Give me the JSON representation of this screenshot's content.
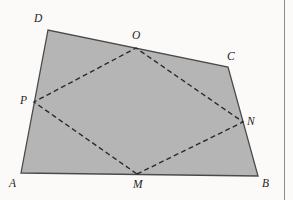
{
  "figure": {
    "type": "geometry-diagram",
    "background_color": "#fbfaf8",
    "fill_color": "#b5b5b5",
    "outline_color": "#4a4a4a",
    "dash_color": "#2b2b2b",
    "outline_width": 1.3,
    "dash_width": 1.4,
    "dash_pattern": "5,3.2",
    "outer_vertices": [
      {
        "id": "A",
        "label": "A",
        "x": 21,
        "y": 173,
        "label_x": 9,
        "label_y": 178
      },
      {
        "id": "B",
        "label": "B",
        "x": 258,
        "y": 176,
        "label_x": 262,
        "label_y": 178
      },
      {
        "id": "C",
        "label": "C",
        "x": 228,
        "y": 67,
        "label_x": 227,
        "label_y": 51
      },
      {
        "id": "D",
        "label": "D",
        "x": 48,
        "y": 30,
        "label_x": 34,
        "label_y": 13
      }
    ],
    "midpoints": [
      {
        "id": "M",
        "label": "M",
        "on_side": "AB",
        "x": 137,
        "y": 174,
        "label_x": 133,
        "label_y": 179
      },
      {
        "id": "N",
        "label": "N",
        "on_side": "BC",
        "x": 243,
        "y": 122,
        "label_x": 247,
        "label_y": 116
      },
      {
        "id": "O",
        "label": "O",
        "on_side": "CD",
        "x": 136,
        "y": 48,
        "label_x": 132,
        "label_y": 30
      },
      {
        "id": "P",
        "label": "P",
        "on_side": "DA",
        "x": 34,
        "y": 102,
        "label_x": 20,
        "label_y": 95
      }
    ],
    "outer_polygon_path": "M 21,173 L 48,30 L 228,67 L 258,176 Z",
    "inner_polygon_path": "M 137,174 L 243,122 L 136,48 L 34,102 Z",
    "margin_rule": {
      "x": 284,
      "color": "#8d8d8d"
    }
  }
}
